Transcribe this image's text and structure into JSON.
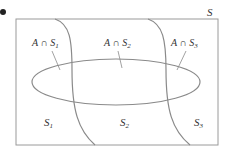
{
  "diagram": {
    "universe_label": "S",
    "intersections": [
      {
        "set": "A",
        "op": "∩",
        "part": "S",
        "sub": "1"
      },
      {
        "set": "A",
        "op": "∩",
        "part": "S",
        "sub": "2"
      },
      {
        "set": "A",
        "op": "∩",
        "part": "S",
        "sub": "3"
      }
    ],
    "partitions": [
      {
        "name": "S",
        "sub": "1"
      },
      {
        "name": "S",
        "sub": "2"
      },
      {
        "name": "S",
        "sub": "3"
      }
    ],
    "colors": {
      "stroke": "#8a8a8a",
      "text": "#333333",
      "bullet": "#222222"
    }
  }
}
